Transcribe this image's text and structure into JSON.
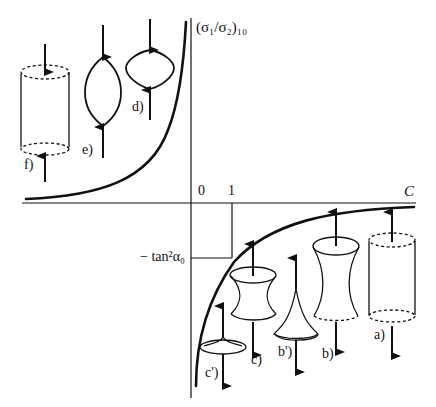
{
  "diagram": {
    "y_axis_label": "(σ₁/σ₂)₁₀",
    "x_axis_label": "C",
    "x_ticks": [
      "0",
      "1"
    ],
    "y_tick_label": "− tan²α₀",
    "shapes_upper_left": [
      {
        "id": "f",
        "label": "f)",
        "description": "cylinder, compressed (arrows pointing inward)"
      },
      {
        "id": "e",
        "label": "e)",
        "description": "lens/spindle shape, compressed"
      },
      {
        "id": "d",
        "label": "d)",
        "description": "rounded barrel shape, compressed"
      }
    ],
    "shapes_lower_right": [
      {
        "id": "c_prime",
        "label": "c')",
        "description": "flat cusp disc, stretched"
      },
      {
        "id": "c",
        "label": "c)",
        "description": "short hyperboloid, stretched"
      },
      {
        "id": "b_prime",
        "label": "b')",
        "description": "cusp cone, stretched"
      },
      {
        "id": "b",
        "label": "b)",
        "description": "tall hyperboloid, stretched"
      },
      {
        "id": "a",
        "label": "a)",
        "description": "cylinder, stretched (arrows pointing outward)"
      }
    ]
  }
}
